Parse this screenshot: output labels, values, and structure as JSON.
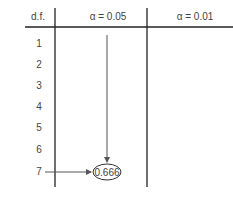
{
  "table": {
    "headers": [
      "d.f.",
      "α = 0.05",
      "α = 0.01"
    ],
    "rows": [
      "1",
      "2",
      "3",
      "4",
      "5",
      "6",
      "7"
    ],
    "highlighted_value": "0.666",
    "highlight_row": "7",
    "highlight_column": "α = 0.05"
  },
  "colors": {
    "lines": "#222222",
    "arrows": "#555555",
    "text": "#444444"
  }
}
